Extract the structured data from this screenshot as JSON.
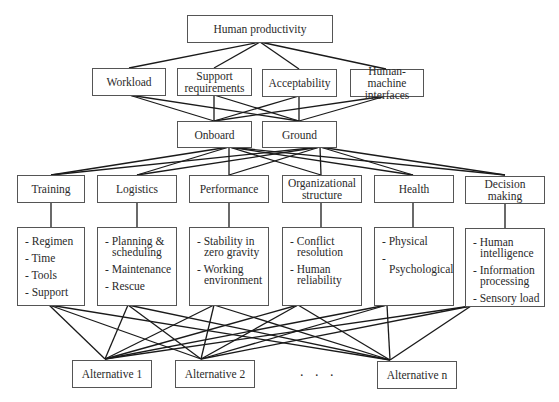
{
  "diagram": {
    "type": "hierarchy",
    "goal": {
      "label": "Human productivity"
    },
    "criteria": [
      {
        "label": "Workload"
      },
      {
        "label": "Support requirements"
      },
      {
        "label": "Acceptability"
      },
      {
        "label": "Human-machine interfaces"
      }
    ],
    "locations": [
      {
        "label": "Onboard"
      },
      {
        "label": "Ground"
      }
    ],
    "factors": [
      {
        "label": "Training",
        "items": [
          "- Regimen",
          "- Time",
          "- Tools",
          "- Support"
        ]
      },
      {
        "label": "Logistics",
        "items": [
          "- Planning & scheduling",
          "- Maintenance",
          "- Rescue"
        ]
      },
      {
        "label": "Performance",
        "items": [
          "- Stability in zero gravity",
          "- Working environment"
        ]
      },
      {
        "label": "Organizational structure",
        "items": [
          "- Conflict resolution",
          "- Human reliability"
        ]
      },
      {
        "label": "Health",
        "items": [
          "- Physical",
          "- Psychological"
        ]
      },
      {
        "label": "Decision making",
        "items": [
          "- Human intelligence",
          "- Information processing",
          "- Sensory load"
        ]
      }
    ],
    "alternatives": [
      {
        "label": "Alternative 1"
      },
      {
        "label": "Alternative 2"
      },
      {
        "label": "Alternative n"
      }
    ],
    "ellipsis": ". . ."
  }
}
